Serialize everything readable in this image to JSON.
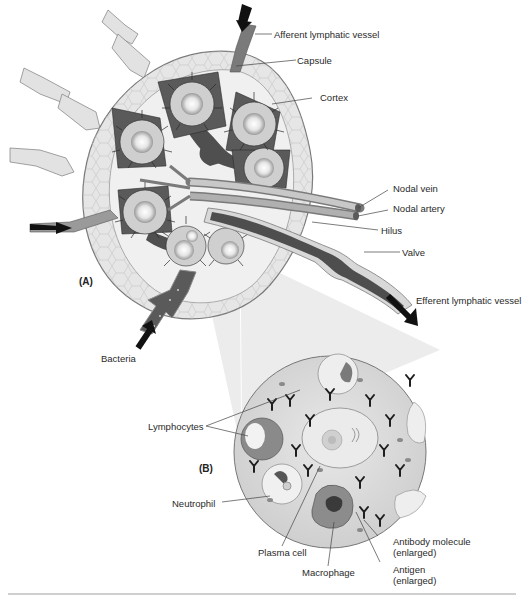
{
  "figure": {
    "panels": [
      {
        "id": "A",
        "label": "(A)",
        "title": "Lymph node cross-section"
      },
      {
        "id": "B",
        "label": "(B)",
        "title": "Enlarged view of cortex"
      }
    ],
    "panel_a_labels": {
      "afferent": "Afferent lymphatic vessel",
      "capsule": "Capsule",
      "cortex": "Cortex",
      "nodal_vein": "Nodal vein",
      "nodal_artery": "Nodal artery",
      "hilus": "Hilus",
      "valve": "Valve",
      "efferent": "Efferent lymphatic vessel",
      "bacteria": "Bacteria"
    },
    "panel_b_labels": {
      "lymphocytes": "Lymphocytes",
      "neutrophil": "Neutrophil",
      "plasma_cell": "Plasma cell",
      "macrophage": "Macrophage",
      "antibody_line1": "Antibody molecule",
      "antibody_line2": "(enlarged)",
      "antigen_line1": "Antigen",
      "antigen_line2": "(enlarged)"
    },
    "colors": {
      "background": "#ffffff",
      "capsule_fill": "#e4e4e4",
      "medulla_dark": "#4a4a4a",
      "follicle_glow": "#f4f4f4",
      "zoom_cone": "#e9e9e9",
      "inset_fill": "#dcdcdc",
      "rule": "#cfcfcf"
    }
  }
}
